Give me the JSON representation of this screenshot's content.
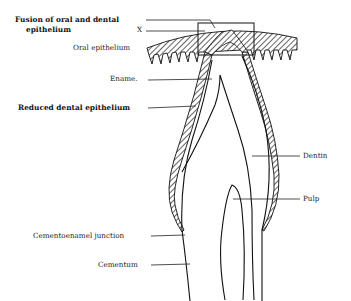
{
  "diagram": {
    "colors": {
      "ink": "#111111",
      "background": "#ffffff"
    },
    "labels": {
      "fusion_line1": "Fusion of oral and dental",
      "fusion_line2": "epithelium",
      "x_mark": "X",
      "oral_epithelium": "Oral epithelium",
      "enamel": "Ename.",
      "reduced_dental_epithelium": "Reduced dental epithelium",
      "dentin": "Dentin",
      "pulp": "Pulp",
      "cementoenamel_junction": "Cementoenamel junction",
      "cementum": "Cementum"
    }
  }
}
